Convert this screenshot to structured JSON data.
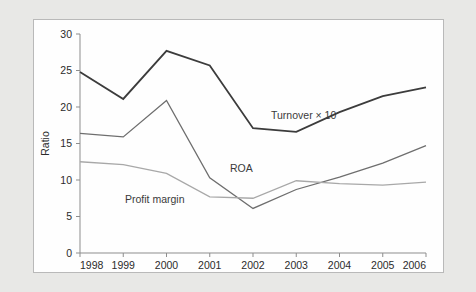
{
  "chart_data": {
    "type": "line",
    "title": "",
    "xlabel": "",
    "ylabel": "Ratio",
    "categories": [
      "1998",
      "1999",
      "2000",
      "2001",
      "2002",
      "2003",
      "2004",
      "2005",
      "2006"
    ],
    "x": [
      1998,
      1999,
      2000,
      2001,
      2002,
      2003,
      2004,
      2005,
      2006
    ],
    "xlim": [
      1998,
      2006
    ],
    "ylim": [
      0,
      30
    ],
    "yticks": [
      0,
      5,
      10,
      15,
      20,
      25,
      30
    ],
    "xticks": [
      1998,
      1999,
      2000,
      2001,
      2002,
      2003,
      2004,
      2005,
      2006
    ],
    "grid": false,
    "legend": "inline-annotations",
    "series": [
      {
        "name": "Turnover × 10",
        "color": "#3c3c3c",
        "width": 1.8,
        "values": [
          24.8,
          21.1,
          27.7,
          25.7,
          17.1,
          16.6,
          19.3,
          21.5,
          22.7
        ]
      },
      {
        "name": "ROA",
        "color": "#6e6e6e",
        "width": 1.3,
        "values": [
          16.4,
          15.9,
          20.9,
          10.3,
          6.1,
          8.7,
          10.4,
          12.3,
          14.7
        ]
      },
      {
        "name": "Profit margin",
        "color": "#a8a8a8",
        "width": 1.3,
        "values": [
          12.5,
          12.1,
          10.9,
          7.7,
          7.5,
          9.9,
          9.5,
          9.3,
          9.7
        ]
      }
    ],
    "annotations": [
      {
        "text": "Turnover × 10",
        "series": "Turnover × 10",
        "x_px": 237,
        "y_px": 99
      },
      {
        "text": "ROA",
        "series": "ROA",
        "x_px": 196,
        "y_px": 152
      },
      {
        "text": "Profit margin",
        "series": "Profit margin",
        "x_px": 91,
        "y_px": 183
      }
    ]
  },
  "axes": {
    "y_title": "Ratio",
    "y_tick_labels": [
      "30",
      "25",
      "20",
      "15",
      "10",
      "5",
      "0"
    ],
    "x_tick_labels": [
      "1998",
      "1999",
      "2000",
      "2001",
      "2002",
      "2003",
      "2004",
      "2005",
      "2006"
    ]
  },
  "colors": {
    "page_background": "#e8e8e6",
    "panel_background": "#fefefe",
    "panel_border": "#b9b9b9",
    "axis": "#8d8d8d",
    "turnover": "#3c3c3c",
    "roa": "#6e6e6e",
    "profit_margin": "#a8a8a8",
    "text": "#2b2b2b"
  }
}
